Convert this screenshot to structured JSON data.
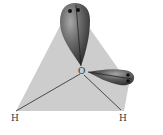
{
  "diagram": {
    "central_atom": "O",
    "atoms": [
      {
        "label": "H",
        "position": "bottom-left"
      },
      {
        "label": "H",
        "position": "bottom-right"
      }
    ],
    "lone_pairs": [
      {
        "direction": "up",
        "electrons": 2
      },
      {
        "direction": "right",
        "electrons": 2
      }
    ],
    "colors": {
      "plane": "#cfcfcf",
      "lobe_dark": "#3a3a3a",
      "lobe_light": "#9a9a9a",
      "bond": "#444444"
    }
  }
}
